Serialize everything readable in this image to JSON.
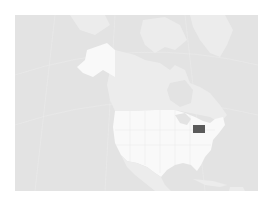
{
  "map": {
    "title": "Locator map of Pennsylvania in North America",
    "highlighted_region": "Pennsylvania",
    "regions": [
      "Alaska",
      "Canada",
      "Contiguous United States",
      "Mexico",
      "Greenland",
      "Cuba",
      "Caribbean",
      "Pennsylvania"
    ],
    "colors": {
      "ocean": "#e3e3e3",
      "other_land": "#ececec",
      "country_land": "#f9f9f9",
      "highlight": "#5a5a5a",
      "borders": "#dcdcdc"
    }
  }
}
